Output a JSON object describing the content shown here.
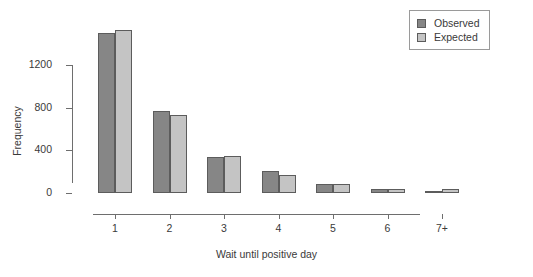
{
  "chart_data": {
    "type": "bar",
    "title": "",
    "xlabel": "Wait until positive day",
    "ylabel": "Frequency",
    "categories": [
      "1",
      "2",
      "3",
      "4",
      "5",
      "6",
      "7+"
    ],
    "series": [
      {
        "name": "Observed",
        "color": "#868686",
        "values": [
          1500,
          765,
          340,
          210,
          85,
          40,
          15
        ]
      },
      {
        "name": "Expected",
        "color": "#c4c4c4",
        "values": [
          1530,
          730,
          350,
          165,
          80,
          38,
          35
        ]
      }
    ],
    "ylim": [
      0,
      1600
    ],
    "y_ticks": [
      0,
      400,
      800,
      1200
    ],
    "y_tick_labels": [
      "0",
      "400",
      "800",
      "1200"
    ],
    "x_tick_labels": [
      "1",
      "2",
      "3",
      "4",
      "5",
      "6",
      "7+"
    ],
    "grid": false,
    "legend_position": "top-right",
    "legend_entries": [
      "Observed",
      "Expected"
    ]
  },
  "legend": {
    "observed_label": "Observed",
    "expected_label": "Expected"
  },
  "axes": {
    "x_title": "Wait until positive day",
    "y_title": "Frequency"
  }
}
